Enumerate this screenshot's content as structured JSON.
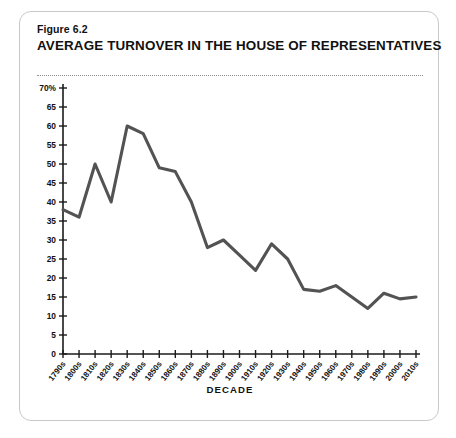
{
  "figure": {
    "number": "Figure 6.2",
    "title": "AVERAGE TURNOVER IN THE HOUSE OF REPRESENTATIVES"
  },
  "chart_data": {
    "type": "line",
    "title": "AVERAGE TURNOVER IN THE HOUSE OF REPRESENTATIVES",
    "subtitle": "Figure 6.2",
    "xlabel": "DECADE",
    "ylabel": "",
    "ylim": [
      0,
      70
    ],
    "ytick_step": 5,
    "ytick_labels": [
      "0",
      "5",
      "10",
      "15",
      "20",
      "25",
      "30",
      "35",
      "40",
      "45",
      "50",
      "55",
      "60",
      "65",
      "70%"
    ],
    "grid": false,
    "legend": null,
    "line_color": "#535353",
    "categories": [
      "1790s",
      "1800s",
      "1810s",
      "1820s",
      "1830s",
      "1840s",
      "1850s",
      "1860s",
      "1870s",
      "1880s",
      "1890s",
      "1900s",
      "1910s",
      "1920s",
      "1930s",
      "1940s",
      "1950s",
      "1960s",
      "1970s",
      "1980s",
      "1990s",
      "2000s",
      "2010s"
    ],
    "values": [
      38,
      36,
      50,
      40,
      60,
      58,
      49,
      48,
      40,
      28,
      30,
      26,
      22,
      29,
      25,
      17,
      16.5,
      18,
      15,
      12,
      16,
      14.5,
      15
    ]
  },
  "axis": {
    "x_title": "DECADE"
  }
}
